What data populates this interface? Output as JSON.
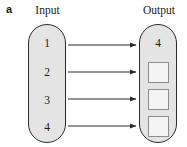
{
  "figure": {
    "panel_letter": "a",
    "colors": {
      "box_fill": "#e4e4e4",
      "box_stroke": "#2b2b2b",
      "square_fill": "#f4f4f4",
      "square_stroke": "#8c8c8c",
      "arrow": "#2b2b2b",
      "text": "#1a1a1a",
      "background": "#ffffff"
    }
  },
  "input": {
    "header": "Input",
    "items": [
      {
        "label": "1"
      },
      {
        "label": "2"
      },
      {
        "label": "3"
      },
      {
        "label": "4"
      }
    ]
  },
  "output": {
    "header": "Output",
    "items": [
      {
        "label": "4",
        "kind": "value"
      },
      {
        "label": "",
        "kind": "empty-square"
      },
      {
        "label": "",
        "kind": "empty-square"
      },
      {
        "label": "",
        "kind": "empty-square"
      }
    ]
  },
  "arrows": {
    "count": 4,
    "direction": "left-to-right",
    "icon": "arrow-right-icon"
  }
}
